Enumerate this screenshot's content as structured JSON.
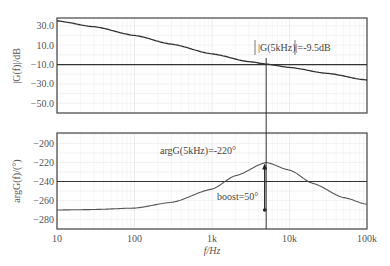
{
  "chart_data": [
    {
      "type": "line",
      "title": "",
      "xlabel": "f/Hz",
      "ylabel": "|G(f)|/dB",
      "xscale": "log",
      "xlim": [
        10,
        100000
      ],
      "ylim": [
        -60,
        38
      ],
      "xticks": [
        10,
        100,
        1000,
        10000,
        100000
      ],
      "xtick_labels": [
        "10",
        "100",
        "1k",
        "10k",
        "100k"
      ],
      "yticks": [
        30,
        10,
        -10,
        -30,
        -50
      ],
      "ytick_labels": [
        "30.0",
        "10.0",
        "-10.0",
        "-30.0",
        "-50.0"
      ],
      "grid": true,
      "series": [
        {
          "name": "|G(f)|",
          "x": [
            10,
            30,
            100,
            300,
            1000,
            3000,
            5000,
            10000,
            30000,
            100000
          ],
          "values": [
            35,
            29,
            20,
            11,
            1,
            -7,
            -9.5,
            -13,
            -19,
            -26
          ]
        }
      ],
      "reference_line": {
        "y": -10
      },
      "marker_x": 5000,
      "annotations": [
        "|G(5kHz)|=-9.5dB"
      ]
    },
    {
      "type": "line",
      "title": "",
      "xlabel": "f/Hz",
      "ylabel": "argG(f)/(°)",
      "xscale": "log",
      "xlim": [
        10,
        100000
      ],
      "ylim": [
        -290,
        -189
      ],
      "xticks": [
        10,
        100,
        1000,
        10000,
        100000
      ],
      "xtick_labels": [
        "10",
        "100",
        "1k",
        "10k",
        "100k"
      ],
      "yticks": [
        -200,
        -220,
        -240,
        -260,
        -280
      ],
      "ytick_labels": [
        "-200",
        "-220",
        "-240",
        "-260",
        "-280"
      ],
      "grid": true,
      "series": [
        {
          "name": "argG(f)",
          "x": [
            10,
            30,
            100,
            300,
            1000,
            2000,
            5000,
            10000,
            20000,
            50000,
            100000
          ],
          "values": [
            -270,
            -269.5,
            -268,
            -262,
            -248,
            -234,
            -220,
            -228,
            -242,
            -257,
            -264
          ]
        }
      ],
      "reference_line": {
        "y": -240
      },
      "marker_x": 5000,
      "boost_arrow": {
        "from": -270,
        "to": -220
      },
      "annotations": [
        "argG(5kHz)=-220°",
        "boost=50°"
      ]
    }
  ],
  "labels": {
    "top_ylabel": "|G(f)|/dB",
    "bottom_ylabel": "argG(f)/(°)",
    "xlabel": "f/Hz",
    "mag_annotation": "|G(5kHz)|=-9.5dB",
    "phase_annotation": "argG(5kHz)=-220°",
    "boost_annotation": "boost=50°"
  }
}
